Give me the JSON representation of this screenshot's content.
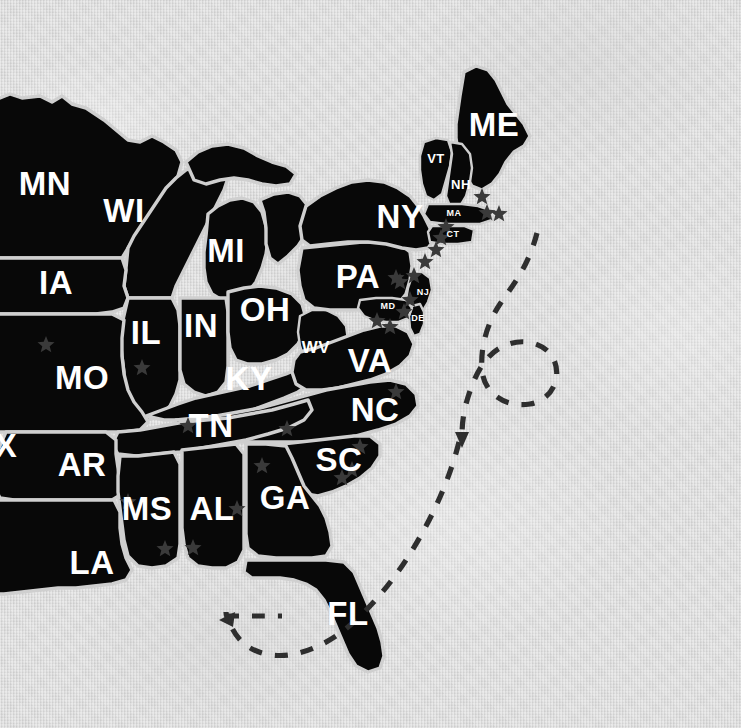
{
  "map": {
    "title": "Eastern United States State Map",
    "region": "Eastern and Midwestern United States",
    "style": "black silhouette states on textured light gray paper",
    "background_color": "#dcdcdc",
    "state_fill_color": "#080808",
    "state_border_color": "#cfcfcf",
    "label_color": "#ffffff",
    "star_color": "#3a3a3a",
    "route_color": "#2e2e2e"
  },
  "states": [
    {
      "code": "MN",
      "name": "Minnesota",
      "x": 45,
      "y": 183,
      "size": "lg"
    },
    {
      "code": "WI",
      "name": "Wisconsin",
      "x": 124,
      "y": 210,
      "size": "lg"
    },
    {
      "code": "MI",
      "name": "Michigan",
      "x": 226,
      "y": 250,
      "size": "lg"
    },
    {
      "code": "IA",
      "name": "Iowa",
      "x": 56,
      "y": 282,
      "size": "lg"
    },
    {
      "code": "IL",
      "name": "Illinois",
      "x": 146,
      "y": 332,
      "size": "lg"
    },
    {
      "code": "IN",
      "name": "Indiana",
      "x": 201,
      "y": 325,
      "size": "lg"
    },
    {
      "code": "OH",
      "name": "Ohio",
      "x": 265,
      "y": 309,
      "size": "lg"
    },
    {
      "code": "MO",
      "name": "Missouri",
      "x": 82,
      "y": 377,
      "size": "lg"
    },
    {
      "code": "KY",
      "name": "Kentucky",
      "x": 249,
      "y": 378,
      "size": "lg"
    },
    {
      "code": "TN",
      "name": "Tennessee",
      "x": 211,
      "y": 425,
      "size": "lg"
    },
    {
      "code": "AR",
      "name": "Arkansas",
      "x": 82,
      "y": 464,
      "size": "lg"
    },
    {
      "code": "MS",
      "name": "Mississippi",
      "x": 147,
      "y": 508,
      "size": "lg"
    },
    {
      "code": "AL",
      "name": "Alabama",
      "x": 212,
      "y": 508,
      "size": "lg"
    },
    {
      "code": "LA",
      "name": "Louisiana",
      "x": 92,
      "y": 562,
      "size": "lg"
    },
    {
      "code": "GA",
      "name": "Georgia",
      "x": 285,
      "y": 497,
      "size": "lg"
    },
    {
      "code": "SC",
      "name": "South Carolina",
      "x": 339,
      "y": 459,
      "size": "lg"
    },
    {
      "code": "NC",
      "name": "North Carolina",
      "x": 375,
      "y": 409,
      "size": "lg"
    },
    {
      "code": "VA",
      "name": "Virginia",
      "x": 370,
      "y": 360,
      "size": "lg"
    },
    {
      "code": "PA",
      "name": "Pennsylvania",
      "x": 358,
      "y": 276,
      "size": "lg"
    },
    {
      "code": "NY",
      "name": "New York",
      "x": 400,
      "y": 216,
      "size": "lg"
    },
    {
      "code": "ME",
      "name": "Maine",
      "x": 494,
      "y": 124,
      "size": "lg"
    },
    {
      "code": "FL",
      "name": "Florida",
      "x": 348,
      "y": 613,
      "size": "lg"
    },
    {
      "code": "X",
      "name": "Texas",
      "x": 6,
      "y": 445,
      "size": "lg"
    },
    {
      "code": "WV",
      "name": "West Virginia",
      "x": 316,
      "y": 347,
      "size": "sm"
    },
    {
      "code": "VT",
      "name": "Vermont",
      "x": 436,
      "y": 158,
      "size": "xs"
    },
    {
      "code": "NH",
      "name": "New Hampshire",
      "x": 461,
      "y": 184,
      "size": "xs"
    },
    {
      "code": "MA",
      "name": "Massachusetts",
      "x": 454,
      "y": 213,
      "size": "xxs"
    },
    {
      "code": "CT",
      "name": "Connecticut",
      "x": 453,
      "y": 234,
      "size": "xxs"
    },
    {
      "code": "NJ",
      "name": "New Jersey",
      "x": 423,
      "y": 292,
      "size": "xxs"
    },
    {
      "code": "MD",
      "name": "Maryland",
      "x": 388,
      "y": 306,
      "size": "xxs"
    },
    {
      "code": "DE",
      "name": "Delaware",
      "x": 418,
      "y": 318,
      "size": "xxs"
    }
  ],
  "star_markers": [
    {
      "label": "marker",
      "x": 46,
      "y": 345
    },
    {
      "label": "marker",
      "x": 142,
      "y": 368
    },
    {
      "label": "marker",
      "x": 188,
      "y": 426
    },
    {
      "label": "marker",
      "x": 165,
      "y": 549
    },
    {
      "label": "marker",
      "x": 128,
      "y": 502
    },
    {
      "label": "marker",
      "x": 193,
      "y": 548
    },
    {
      "label": "marker",
      "x": 237,
      "y": 509
    },
    {
      "label": "marker",
      "x": 262,
      "y": 466
    },
    {
      "label": "marker",
      "x": 287,
      "y": 429
    },
    {
      "label": "marker",
      "x": 342,
      "y": 478
    },
    {
      "label": "marker",
      "x": 352,
      "y": 470
    },
    {
      "label": "marker",
      "x": 360,
      "y": 447
    },
    {
      "label": "marker",
      "x": 396,
      "y": 392
    },
    {
      "label": "marker",
      "x": 400,
      "y": 282
    },
    {
      "label": "marker",
      "x": 377,
      "y": 321
    },
    {
      "label": "marker",
      "x": 390,
      "y": 327
    },
    {
      "label": "marker",
      "x": 404,
      "y": 312
    },
    {
      "label": "marker",
      "x": 410,
      "y": 300
    },
    {
      "label": "marker",
      "x": 414,
      "y": 276
    },
    {
      "label": "marker",
      "x": 396,
      "y": 278
    },
    {
      "label": "marker",
      "x": 425,
      "y": 262
    },
    {
      "label": "marker",
      "x": 436,
      "y": 250
    },
    {
      "label": "marker",
      "x": 441,
      "y": 238
    },
    {
      "label": "marker",
      "x": 446,
      "y": 227
    },
    {
      "label": "marker",
      "x": 482,
      "y": 197
    },
    {
      "label": "marker",
      "x": 487,
      "y": 213
    },
    {
      "label": "marker",
      "x": 499,
      "y": 214
    }
  ],
  "routes": [
    {
      "name": "atlantic-loop-route",
      "description": "dashed path descending from northeast then looping clockwise and arrowing down near the Carolinas coast",
      "arrow_direction": "down"
    },
    {
      "name": "gulf-route",
      "description": "dashed path sweeping around the Florida peninsula into the Gulf with an arrow pointing west",
      "arrow_direction": "left"
    }
  ]
}
